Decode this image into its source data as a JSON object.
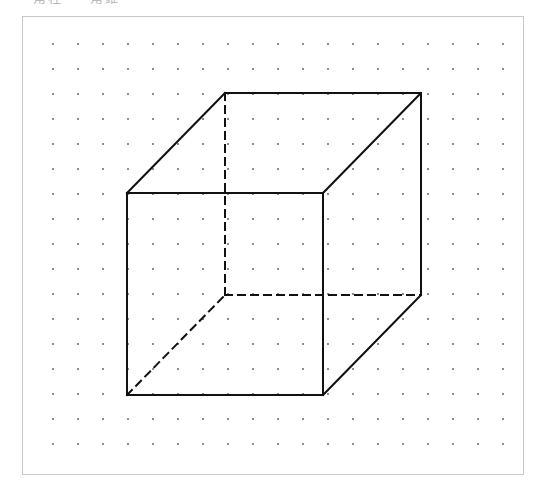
{
  "page": {
    "width": 545,
    "height": 493,
    "background_color": "#ffffff"
  },
  "header": {
    "clipped_text": "角柱 ・ 角錐"
  },
  "figure": {
    "frame": {
      "x": 22,
      "y": 16,
      "width": 502,
      "height": 459,
      "border_color": "#c9c9c9",
      "background_color": "#ffffff"
    },
    "dot_grid": {
      "dot_color": "#8c8c92",
      "dot_size": 2,
      "spacing": 25,
      "origin_x": 29,
      "origin_y": 26,
      "columns": 19,
      "rows": 17
    },
    "drawing": {
      "name": "cube-isometric",
      "stroke_color": "#111111",
      "stroke_width": 2,
      "dash_pattern": "7,6",
      "vertices": {
        "front_top_left": {
          "x": 104,
          "y": 176
        },
        "front_top_right": {
          "x": 300,
          "y": 176
        },
        "front_bottom_right": {
          "x": 300,
          "y": 378
        },
        "front_bottom_left": {
          "x": 104,
          "y": 378
        },
        "back_top_left": {
          "x": 202,
          "y": 76
        },
        "back_top_right": {
          "x": 398,
          "y": 76
        },
        "back_bottom_right": {
          "x": 398,
          "y": 278
        },
        "back_bottom_left": {
          "x": 202,
          "y": 278
        }
      },
      "solid_edges": [
        [
          "front_top_left",
          "front_top_right"
        ],
        [
          "front_top_right",
          "front_bottom_right"
        ],
        [
          "front_bottom_right",
          "front_bottom_left"
        ],
        [
          "front_bottom_left",
          "front_top_left"
        ],
        [
          "back_top_left",
          "back_top_right"
        ],
        [
          "back_top_right",
          "back_bottom_right"
        ],
        [
          "front_top_left",
          "back_top_left"
        ],
        [
          "front_top_right",
          "back_top_right"
        ],
        [
          "front_bottom_right",
          "back_bottom_right"
        ]
      ],
      "dashed_edges": [
        [
          "back_top_left",
          "back_bottom_left"
        ],
        [
          "back_bottom_left",
          "back_bottom_right"
        ],
        [
          "front_bottom_left",
          "back_bottom_left"
        ]
      ]
    }
  }
}
